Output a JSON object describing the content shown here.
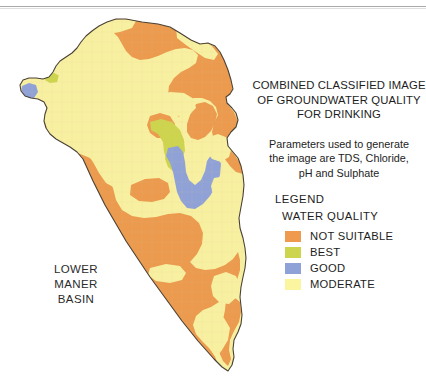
{
  "figure": {
    "background_color": "#ffffff",
    "width": 426,
    "height": 385
  },
  "title": {
    "line1": "COMBINED CLASSIFIED IMAGE",
    "line2": "OF GROUNDWATER QUALITY",
    "line3": "FOR DRINKING"
  },
  "parameters_note": {
    "line1": "Parameters used to generate",
    "line2": "the image are TDS, Chloride,",
    "line3": "pH and Sulphate"
  },
  "legend": {
    "heading": "LEGEND",
    "subheading": "WATER QUALITY",
    "items": [
      {
        "label": "NOT SUITABLE",
        "color": "#ef9a4e"
      },
      {
        "label": "BEST",
        "color": "#cdd44e"
      },
      {
        "label": "GOOD",
        "color": "#8fa2d8"
      },
      {
        "label": "MODERATE",
        "color": "#fbf5a0"
      }
    ]
  },
  "map": {
    "basin_label": "LOWER\nMANER\nBASIN",
    "classes": {
      "not_suitable": "#eb9a4f",
      "best": "#cdd44e",
      "good": "#8fa2d8",
      "moderate": "#f8f0a2",
      "outline": "#4a4136"
    }
  }
}
